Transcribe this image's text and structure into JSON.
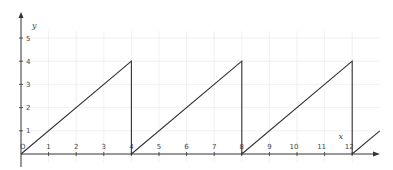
{
  "chart_data": {
    "type": "line",
    "title": "",
    "xlabel": "x",
    "ylabel": "y",
    "origin_label": "O",
    "xlim": [
      0,
      13.5
    ],
    "ylim": [
      0,
      5.5
    ],
    "x_ticks": [
      1,
      2,
      3,
      4,
      5,
      6,
      7,
      8,
      9,
      10,
      11,
      12
    ],
    "y_ticks": [
      1,
      2,
      3,
      4,
      5
    ],
    "grid": true,
    "legend": null,
    "series": [
      {
        "name": "sawtooth",
        "color": "#333333",
        "points": [
          [
            0,
            0
          ],
          [
            4,
            4
          ],
          [
            4,
            0
          ],
          [
            8,
            4
          ],
          [
            8,
            0
          ],
          [
            12,
            4
          ],
          [
            12,
            0
          ],
          [
            13,
            1
          ]
        ]
      }
    ]
  },
  "colors": {
    "axis": "#333333",
    "grid": "#e6e6e6",
    "line": "#333333",
    "text": "#444444"
  }
}
